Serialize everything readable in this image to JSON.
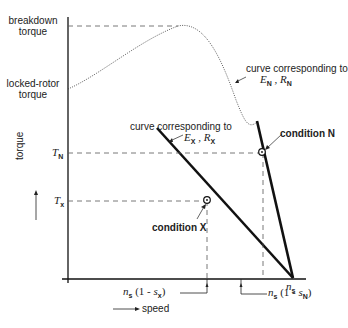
{
  "diagram": {
    "axes": {
      "y_label": "torque",
      "x_label": "speed"
    },
    "y_labels": {
      "breakdown": [
        "breakdown",
        "torque"
      ],
      "locked_rotor": [
        "locked-rotor",
        "torque"
      ],
      "T_N": {
        "sym": "T",
        "sub": "N"
      },
      "T_X": {
        "sym": "T",
        "sub": "x"
      }
    },
    "x_labels": {
      "ns": {
        "sym": "n",
        "sub": "s"
      },
      "nsx": {
        "pre": "n",
        "sub1": "s",
        "mid": " (1 - ",
        "sym2": "s",
        "sub2": "x",
        "post": ")"
      },
      "nsn": {
        "pre": "n",
        "sub1": "s",
        "mid": " (1 - ",
        "sym2": "s",
        "sub2": "N",
        "post": ")"
      }
    },
    "annotations": {
      "curve_N": {
        "line1": "curve corresponding to",
        "E": "E",
        "E_sub": "N",
        "sep": " , ",
        "R": "R",
        "R_sub": "N"
      },
      "curve_X": {
        "line1": "curve corresponding to",
        "E": "E",
        "E_sub": "X",
        "sep": " , ",
        "R": "R",
        "R_sub": "X"
      },
      "condition_N": "condition N",
      "condition_X": "condition X"
    },
    "colors": {
      "line": "#111111",
      "dashed": "#555555",
      "background": "#ffffff"
    }
  }
}
